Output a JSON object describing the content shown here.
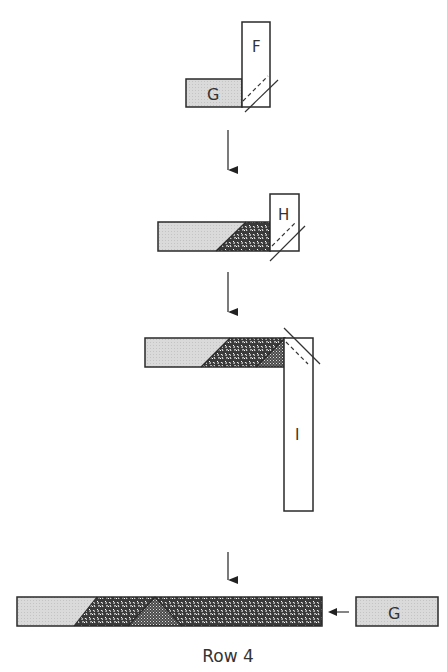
{
  "diagram": {
    "caption": "Row 4",
    "colors": {
      "outline": "#2a2a2a",
      "light_fabric": "#d9d9d9",
      "print_fabric_bg": "#3a3a3a",
      "print_fabric_fg": "#ffffff",
      "blank_fabric": "#ffffff"
    },
    "steps": [
      {
        "id": "step1",
        "pieces": [
          {
            "label": "F",
            "fill": "blank",
            "orientation": "vertical"
          },
          {
            "label": "G",
            "fill": "light",
            "orientation": "horizontal"
          }
        ],
        "sew_line": "diagonal-dashed"
      },
      {
        "id": "step2",
        "pieces": [
          {
            "label": "",
            "fill": "light+print",
            "orientation": "horizontal"
          },
          {
            "label": "H",
            "fill": "blank",
            "orientation": "vertical"
          }
        ],
        "sew_line": "diagonal-dashed"
      },
      {
        "id": "step3",
        "pieces": [
          {
            "label": "",
            "fill": "light+print+check",
            "orientation": "horizontal"
          },
          {
            "label": "I",
            "fill": "blank",
            "orientation": "vertical"
          }
        ],
        "sew_line": "diagonal-dashed"
      },
      {
        "id": "step4",
        "pieces": [
          {
            "label": "",
            "fill": "light+print+check",
            "orientation": "horizontal"
          },
          {
            "label": "G",
            "fill": "light",
            "orientation": "horizontal"
          }
        ],
        "join_arrow": "left"
      }
    ],
    "labels": {
      "F": "F",
      "G": "G",
      "H": "H",
      "I": "I",
      "G2": "G"
    }
  }
}
